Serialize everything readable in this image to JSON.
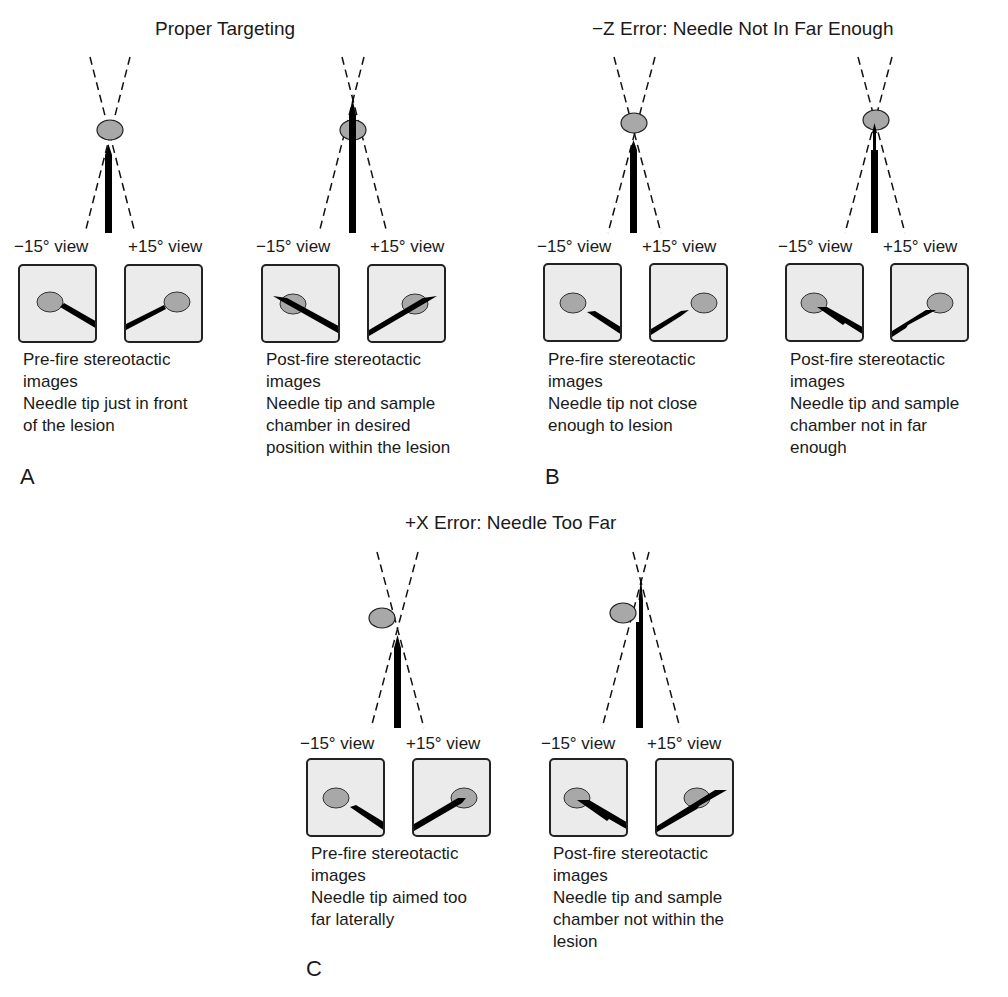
{
  "figure": {
    "panels": [
      {
        "id": "A",
        "letter": "A",
        "title": "Proper Targeting",
        "groups": [
          {
            "stage": "pre-fire",
            "view_labels": [
              "−15° view",
              "+15° view"
            ],
            "caption_lines": [
              "Pre-fire stereotactic",
              "images",
              "Needle tip just in front",
              "of the lesion"
            ]
          },
          {
            "stage": "post-fire",
            "view_labels": [
              "−15° view",
              "+15° view"
            ],
            "caption_lines": [
              "Post-fire stereotactic",
              "images",
              "Needle tip and sample",
              "chamber in desired",
              "position within the lesion"
            ]
          }
        ]
      },
      {
        "id": "B",
        "letter": "B",
        "title": "−Z Error: Needle Not In Far Enough",
        "groups": [
          {
            "stage": "pre-fire",
            "view_labels": [
              "−15° view",
              "+15° view"
            ],
            "caption_lines": [
              "Pre-fire stereotactic",
              "images",
              "Needle tip not close",
              "enough to lesion"
            ]
          },
          {
            "stage": "post-fire",
            "view_labels": [
              "−15° view",
              "+15° view"
            ],
            "caption_lines": [
              "Post-fire stereotactic",
              "images",
              "Needle tip and sample",
              "chamber not in far",
              "enough"
            ]
          }
        ]
      },
      {
        "id": "C",
        "letter": "C",
        "title": "+X Error: Needle Too Far",
        "groups": [
          {
            "stage": "pre-fire",
            "view_labels": [
              "−15° view",
              "+15° view"
            ],
            "caption_lines": [
              "Pre-fire stereotactic",
              "images",
              "Needle tip aimed too",
              "far laterally"
            ]
          },
          {
            "stage": "post-fire",
            "view_labels": [
              "−15° view",
              "+15° view"
            ],
            "caption_lines": [
              "Post-fire stereotactic",
              "images",
              "Needle tip and sample",
              "chamber not within the",
              "lesion"
            ]
          }
        ]
      }
    ],
    "colors": {
      "lesion_fill": "#a8a8a8",
      "needle": "#000000",
      "view_box_bg": "#ebebeb",
      "text": "#1a1a1a"
    }
  }
}
